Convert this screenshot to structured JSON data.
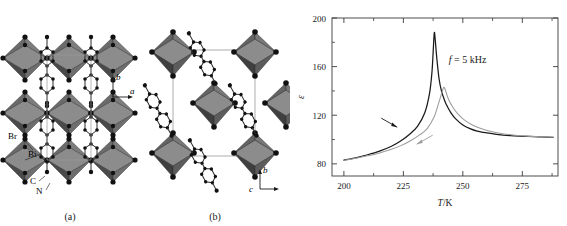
{
  "figure": {
    "panels": [
      {
        "id": "a",
        "caption": "(a)",
        "axes": [
          {
            "name": "b",
            "direction": "up"
          },
          {
            "name": "a",
            "direction": "right"
          }
        ],
        "atom_labels": [
          "Br",
          "Bi",
          "C",
          "N"
        ],
        "view": "packing view along c showing corner-sharing BiBr6 octahedra layers separated by organic cations"
      },
      {
        "id": "b",
        "caption": "(b)",
        "axes": [
          {
            "name": "b",
            "direction": "up"
          },
          {
            "name": "c",
            "direction": "right"
          }
        ],
        "atom_labels": [],
        "view": "packing view along a showing unit cell with isolated octahedra and tilted organic molecules"
      }
    ],
    "colors": {
      "octahedron_front": "#4a4a4a",
      "octahedron_top": "#8c8c8c",
      "octahedron_side": "#6e6e6e",
      "atom": "#1a1a1a",
      "bond": "#2b2b2b",
      "cell_edge": "#9a9a9a",
      "curve_cooling": "#1a1a1a",
      "curve_heating": "#9b9b9b",
      "frame": "#3a3a3a"
    }
  },
  "chart_data": {
    "type": "line",
    "title": "",
    "xlabel": "T/K",
    "ylabel": "ε",
    "xlim": [
      195,
      290
    ],
    "ylim": [
      70,
      200
    ],
    "xticks": [
      200,
      225,
      250,
      275
    ],
    "yticks": [
      80,
      120,
      160,
      200
    ],
    "xticklabels": [
      "200",
      "225",
      "250",
      "275"
    ],
    "yticklabels": [
      "80",
      "120",
      "160",
      "200"
    ],
    "minor_xticks": [
      212.5,
      237.5,
      262.5,
      287.5
    ],
    "minor_yticks": [
      100,
      140,
      180
    ],
    "grid": false,
    "legend": false,
    "annotations": [
      {
        "text": "f = 5 kHz",
        "x": 252,
        "y": 163
      }
    ],
    "arrows": [
      {
        "label": "cooling-direction-arrow",
        "x": 222,
        "y": 111,
        "points": "left"
      },
      {
        "label": "heating-direction-arrow",
        "x": 231,
        "y": 97,
        "points": "right"
      }
    ],
    "series": [
      {
        "name": "cooling",
        "color": "#1a1a1a",
        "peak_x": 238,
        "peak_y": 188,
        "x": [
          200,
          205,
          210,
          215,
          220,
          224,
          228,
          231,
          234,
          236,
          237,
          237.6,
          238,
          238.4,
          239,
          240,
          241,
          242,
          243,
          245,
          247,
          250,
          253,
          256,
          260,
          265,
          270,
          275,
          280,
          285,
          288
        ],
        "y": [
          83,
          85,
          87.5,
          90.5,
          94.5,
          99,
          105,
          111,
          122,
          138,
          155,
          175,
          188,
          182,
          168,
          150,
          140,
          134,
          129,
          122,
          117,
          112,
          109,
          107,
          105.5,
          104,
          103.2,
          102.7,
          102.3,
          102,
          101.8
        ]
      },
      {
        "name": "heating",
        "color": "#9b9b9b",
        "peak_x": 242,
        "peak_y": 143,
        "x": [
          200,
          205,
          210,
          215,
          220,
          224,
          228,
          232,
          235,
          238,
          240,
          241.4,
          242,
          242.6,
          244,
          246,
          248,
          251,
          254,
          257,
          261,
          266,
          271,
          276,
          281,
          285,
          288
        ],
        "y": [
          83,
          84.6,
          86.6,
          89,
          92,
          95,
          99,
          104,
          109,
          119,
          131,
          140,
          143,
          141,
          133,
          126,
          121,
          115.5,
          112,
          109.5,
          107,
          105,
          103.8,
          103,
          102.4,
          102.1,
          101.9
        ]
      }
    ]
  }
}
